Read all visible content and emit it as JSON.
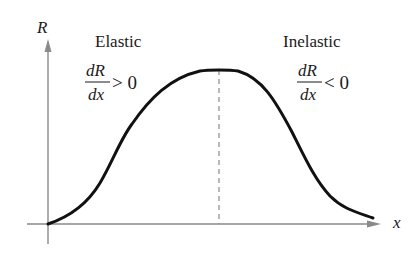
{
  "diagram": {
    "title": "",
    "axes": {
      "y_label": "R",
      "x_label": "x",
      "axis_color": "#8a8a8a"
    },
    "curve": {
      "color": "#111111",
      "description": "Revenue R as a function of x: rises from origin, peaks, then falls"
    },
    "divider": {
      "style": "dashed",
      "color": "#8a8a8a",
      "meaning": "maximum revenue point"
    },
    "regions": [
      {
        "label": "Elastic",
        "numerator": "dR",
        "denominator": "dx",
        "relation": "> 0"
      },
      {
        "label": "Inelastic",
        "numerator": "dR",
        "denominator": "dx",
        "relation": "< 0"
      }
    ]
  }
}
